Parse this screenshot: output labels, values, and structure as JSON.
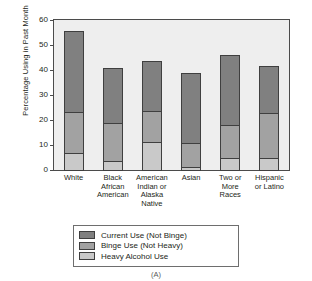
{
  "chart_data": {
    "type": "bar",
    "subtype": "stacked-bar",
    "title": "",
    "xlabel": "",
    "ylabel": "Percentage Using in Past Month",
    "ylim": [
      0,
      60
    ],
    "ytick_values": [
      0,
      10,
      20,
      30,
      40,
      50,
      60
    ],
    "ytick_labels": [
      "0",
      "10",
      "20",
      "30",
      "40",
      "50",
      "60"
    ],
    "grid": false,
    "legend_position": "bottom-center",
    "caption": "(A)",
    "categories": [
      "White",
      "Black African American",
      "American Indian or Alaska Native",
      "Asian",
      "Two or More Races",
      "Hispanic or Latino"
    ],
    "category_lines": [
      [
        "White"
      ],
      [
        "Black",
        "African",
        "American"
      ],
      [
        "American",
        "Indian or",
        "Alaska",
        "Native"
      ],
      [
        "Asian"
      ],
      [
        "Two or",
        "More",
        "Races"
      ],
      [
        "Hispanic",
        "or Latino"
      ]
    ],
    "series": [
      {
        "name": "Heavy Alcohol Use",
        "color": "#c9c9c9",
        "values": [
          7.3,
          4.1,
          11.8,
          1.8,
          5.4,
          5.3
        ]
      },
      {
        "name": "Binge Use (Not Heavy)",
        "color": "#a2a2a2",
        "values": [
          16.6,
          15.4,
          12.7,
          10.0,
          13.6,
          18.3
        ]
      },
      {
        "name": "Current Use (Not Binge)",
        "color": "#808080",
        "values": [
          32.8,
          22.5,
          20.3,
          28.2,
          28.1,
          19.1
        ]
      }
    ],
    "totals": [
      56.7,
      42.0,
      44.8,
      40.0,
      47.1,
      42.7
    ],
    "legend": [
      {
        "label": "Current Use (Not Binge)",
        "color": "#808080",
        "key": "current"
      },
      {
        "label": "Binge Use (Not Heavy)",
        "color": "#a2a2a2",
        "key": "binge"
      },
      {
        "label": "Heavy Alcohol Use",
        "color": "#c9c9c9",
        "key": "heavy"
      }
    ]
  }
}
